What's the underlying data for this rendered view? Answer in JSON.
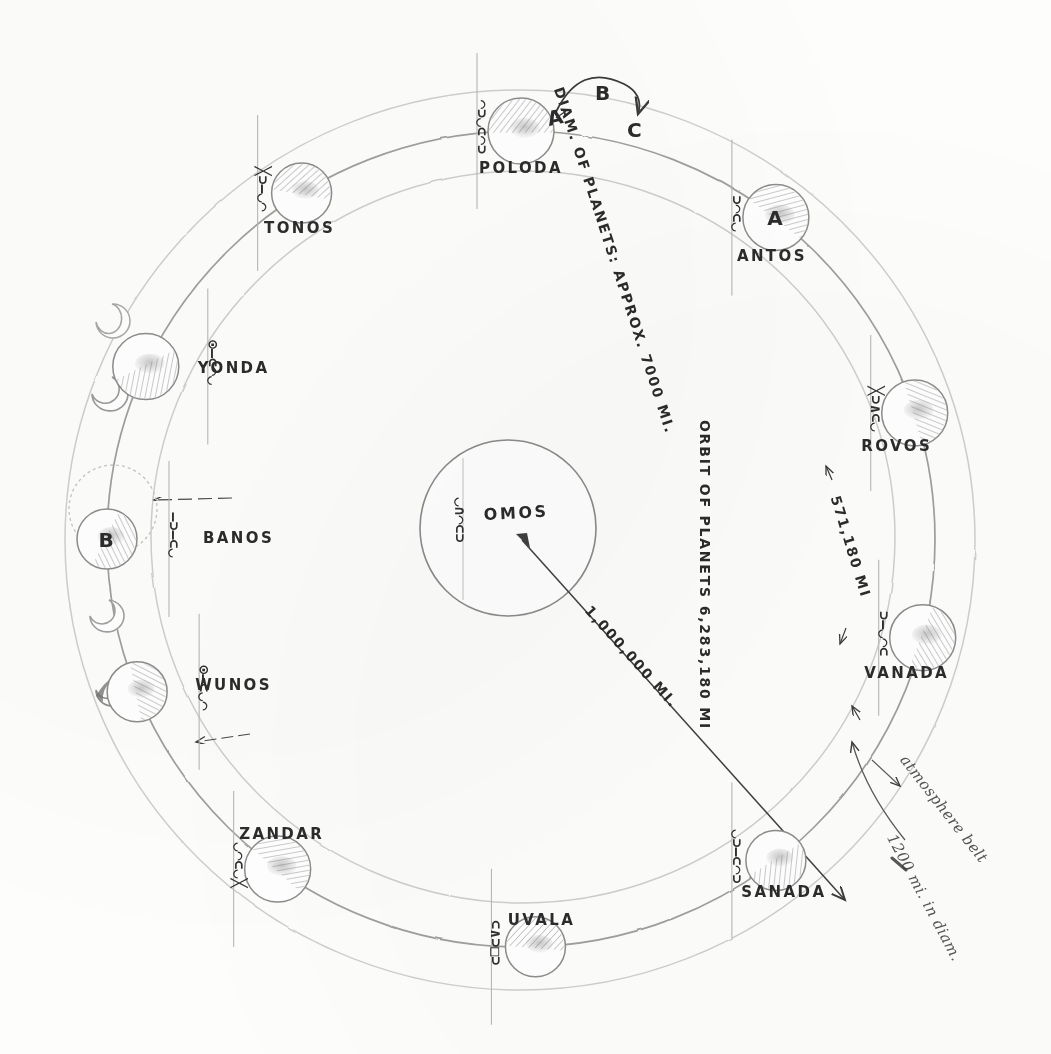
{
  "diagram": {
    "medium": "pencil on paper",
    "sun": {
      "name": "OMOS",
      "glyphs": "◡∩◠⊂⊃"
    },
    "annotations": {
      "diam_of_planets": "DIAM. OF PLANETS: APPROX. 7000 MI.",
      "orbit_of_planets": "ORBIT OF PLANETS 6,283,180 MI",
      "sun_distance": "1,000,000 MI.",
      "planet_spacing": "571,180 MI",
      "atmosphere_belt": "atmosphere belt",
      "atmosphere_diam": "1200 mi. in diam."
    },
    "rotation_marks": {
      "a": "A",
      "b": "B",
      "c": "C"
    },
    "planets": [
      {
        "name": "POLODA",
        "mark": "",
        "angle": -90,
        "glyphs": "◠⊃◡⊂◠⊃",
        "label_dx": 0,
        "label_dy": 42,
        "tick_side": "left"
      },
      {
        "name": "ANTOS",
        "mark": "A",
        "angle": -52,
        "glyphs": "⊃◠⊂◡",
        "label_dx": -4,
        "label_dy": 44,
        "tick_side": "left"
      },
      {
        "name": "ROVOS",
        "mark": "",
        "angle": -18,
        "glyphs": "╳⊃∧⊂◡",
        "label_dx": -18,
        "label_dy": 38,
        "tick_side": "left"
      },
      {
        "name": "VANADA",
        "mark": "",
        "angle": 14,
        "glyphs": "⊃—◡◠⊂",
        "label_dx": -16,
        "label_dy": 40,
        "tick_side": "left"
      },
      {
        "name": "SANADA",
        "mark": "",
        "angle": 52,
        "glyphs": "◡⊃—⊂◠⊃",
        "label_dx": 8,
        "label_dy": 36,
        "tick_side": "left"
      },
      {
        "name": "UVALA",
        "mark": "",
        "angle": 88,
        "glyphs": "⊂∧⊃□⊃",
        "label_dx": 6,
        "label_dy": -22,
        "tick_side": "left"
      },
      {
        "name": "ZANDAR",
        "mark": "",
        "angle": 126,
        "glyphs": "◡◠⊂◡╳",
        "label_dx": 4,
        "label_dy": -30,
        "tick_side": "left"
      },
      {
        "name": "WUNOS",
        "mark": "",
        "angle": 158,
        "glyphs": "⊙—⊂◡◠",
        "label_dx": 58,
        "label_dy": -2,
        "tick_side": "right"
      },
      {
        "name": "BANOS",
        "mark": "B",
        "angle": 180,
        "glyphs": "—⊃—⊂◡",
        "label_dx": 96,
        "label_dy": 4,
        "tick_side": "right"
      },
      {
        "name": "YONDA",
        "mark": "",
        "angle": 205,
        "glyphs": "⊙—⊂◠◡",
        "label_dx": 52,
        "label_dy": 6,
        "tick_side": "right"
      },
      {
        "name": "TONOS",
        "mark": "",
        "angle": 238,
        "glyphs": "╳⊃—◡◠",
        "label_dx": -2,
        "label_dy": 40,
        "tick_side": "left"
      }
    ],
    "moon_phases": [
      {
        "angle": 193,
        "shape": "crescent"
      },
      {
        "angle": 186,
        "shape": "crescent"
      },
      {
        "angle": 172,
        "shape": "crescent"
      },
      {
        "angle": 165,
        "shape": "crescent"
      }
    ],
    "colors": {
      "pencil": "#4a4a4a",
      "pencil_light": "#bdbdbd",
      "pencil_faint": "#d8d8d6",
      "shade": "#7a7a7a",
      "paper": "#fdfdfc"
    }
  }
}
